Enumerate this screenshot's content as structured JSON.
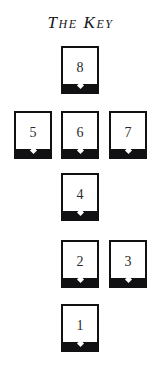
{
  "spread": {
    "title": "The Key",
    "background_color": "#ffffff",
    "card_border_color": "#111114",
    "card_face_color": "#ffffff",
    "card_base_color": "#111114",
    "diamond_color": "#ffffff",
    "numeral_color": "#2a2a2e",
    "layout_type": "cruciform",
    "columns": 3,
    "rows": 5,
    "card_count": 8,
    "cards": [
      {
        "number": "8",
        "column": "center",
        "row": 1
      },
      {
        "number": "5",
        "column": "left",
        "row": 2
      },
      {
        "number": "6",
        "column": "center",
        "row": 2
      },
      {
        "number": "7",
        "column": "right",
        "row": 2
      },
      {
        "number": "4",
        "column": "center",
        "row": 3
      },
      {
        "number": "2",
        "column": "center",
        "row": 4
      },
      {
        "number": "3",
        "column": "right",
        "row": 4
      },
      {
        "number": "1",
        "column": "center",
        "row": 5
      }
    ]
  }
}
